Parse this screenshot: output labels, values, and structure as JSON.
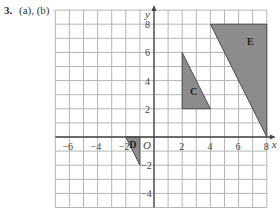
{
  "question": {
    "number": "3.",
    "parts": "(a), (b)"
  },
  "grid": {
    "x_min": -7,
    "x_max": 8,
    "y_min": -5,
    "y_max": 9,
    "x_ticks": [
      -6,
      -4,
      -2,
      2,
      4,
      6,
      8
    ],
    "y_ticks": [
      8,
      6,
      4,
      2,
      -2,
      -4
    ],
    "x_axis_label": "x",
    "y_axis_label": "y",
    "origin_label": "O",
    "grid_color": "#b5b5b5",
    "axis_color": "#444444"
  },
  "shapes": [
    {
      "label": "C",
      "points": [
        [
          2,
          2
        ],
        [
          2,
          6
        ],
        [
          4,
          2
        ]
      ],
      "label_pos": [
        2.55,
        3.0
      ],
      "fill": "#8c8c8c"
    },
    {
      "label": "E",
      "points": [
        [
          4,
          8
        ],
        [
          8,
          8
        ],
        [
          8,
          0
        ]
      ],
      "label_pos": [
        6.6,
        6.5
      ],
      "fill": "#8c8c8c"
    },
    {
      "label": "D",
      "points": [
        [
          -2,
          0
        ],
        [
          -1,
          0
        ],
        [
          -1,
          -2
        ]
      ],
      "label_pos": [
        -1.75,
        -0.75
      ],
      "fill": "#8c8c8c"
    }
  ]
}
